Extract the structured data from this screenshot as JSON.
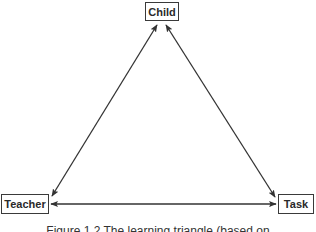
{
  "diagram": {
    "nodes": {
      "child": {
        "label": "Child"
      },
      "teacher": {
        "label": "Teacher"
      },
      "task": {
        "label": "Task"
      }
    },
    "edges": [
      {
        "from": "Child",
        "to": "Teacher",
        "type": "bidirectional-arrow"
      },
      {
        "from": "Child",
        "to": "Task",
        "type": "bidirectional-arrow"
      },
      {
        "from": "Teacher",
        "to": "Task",
        "type": "bidirectional-arrow"
      }
    ],
    "caption": "Figure 1.2 The learning triangle (based on"
  },
  "colors": {
    "line": "#333333",
    "box_border": "#3a3a3a",
    "text": "#2a2a2a",
    "background": "#ffffff"
  }
}
